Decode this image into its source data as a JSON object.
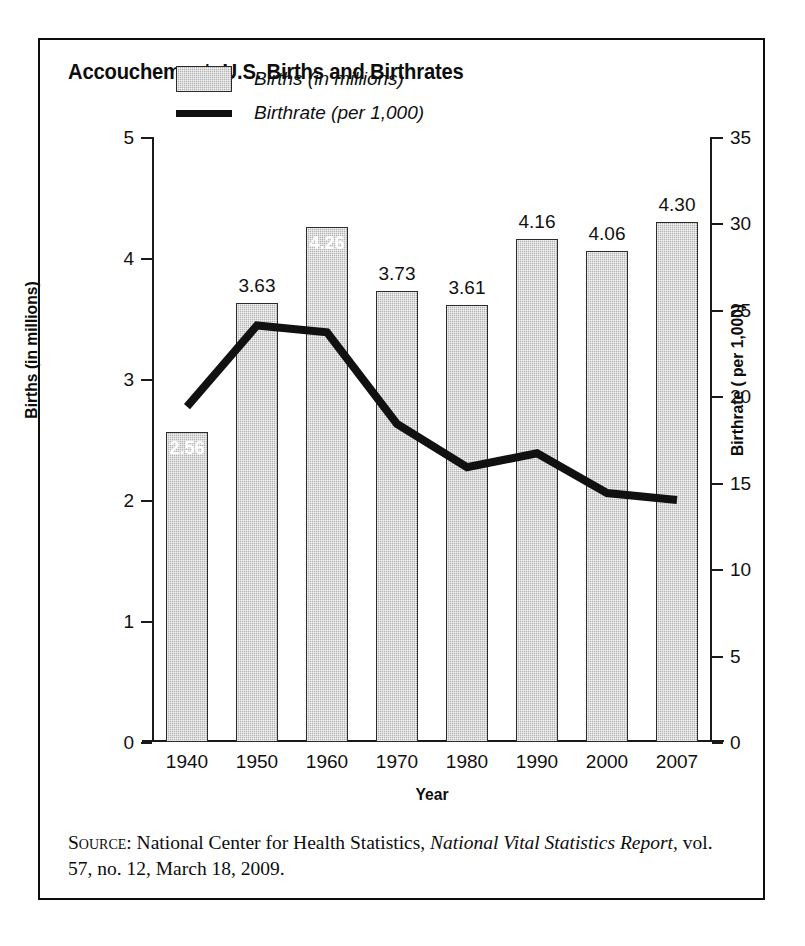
{
  "figure": {
    "title": "Accouchement: U.S. Births and Birthrates",
    "source_label": "Source:",
    "source_text_before": " National Center for Health Statistics, ",
    "source_italic": "National Vital Statistics Report",
    "source_text_after": ", vol. 57, no. 12, March 18, 2009."
  },
  "legend": {
    "position": "top-left-inside",
    "items": [
      {
        "label": "Births (in millions)",
        "marker": "bar-swatch-icon",
        "color": "#b3b3b3"
      },
      {
        "label": "Birthrate (per 1,000)",
        "marker": "line-swatch-icon",
        "color": "#111111"
      }
    ]
  },
  "axes": {
    "x": {
      "title": "Year",
      "ticklabels": [
        "1940",
        "1950",
        "1960",
        "1970",
        "1980",
        "1990",
        "2000",
        "2007"
      ]
    },
    "y_left": {
      "title": "Births (in millions)",
      "ticklabels": [
        "5",
        "4",
        "3",
        "2",
        "1",
        "0"
      ],
      "min": 0,
      "max": 5,
      "step": 1
    },
    "y_right": {
      "title": "Birthrate ( per 1,000)",
      "ticklabels": [
        "35",
        "30",
        "25",
        "20",
        "15",
        "10",
        "5",
        "0"
      ],
      "min": 0,
      "max": 35,
      "step": 5
    }
  },
  "chart_data": {
    "type": "bar",
    "title": "Accouchement: U.S. Births and Birthrates",
    "xlabel": "Year",
    "ylabel": "Births (in millions)",
    "y2label": "Birthrate ( per 1,000)",
    "categories": [
      "1940",
      "1950",
      "1960",
      "1970",
      "1980",
      "1990",
      "2000",
      "2007"
    ],
    "ylim": [
      0,
      5
    ],
    "y2lim": [
      0,
      35
    ],
    "grid": false,
    "legend_position": "upper left",
    "series": [
      {
        "name": "Births (in millions)",
        "type": "bar",
        "axis": "left",
        "color": "#b3b3b3",
        "values": [
          2.56,
          3.63,
          4.26,
          3.73,
          3.61,
          4.16,
          4.06,
          4.3
        ],
        "data_labels": [
          "2.56",
          "3.63",
          "4.26",
          "3.73",
          "3.61",
          "4.16",
          "4.06",
          "4.30"
        ],
        "data_label_inside": [
          true,
          false,
          true,
          false,
          false,
          false,
          false,
          false
        ]
      },
      {
        "name": "Birthrate (per 1,000)",
        "type": "line",
        "axis": "right",
        "color": "#111111",
        "values": [
          19.4,
          24.1,
          23.7,
          18.4,
          15.9,
          16.7,
          14.4,
          14.0
        ]
      }
    ]
  }
}
